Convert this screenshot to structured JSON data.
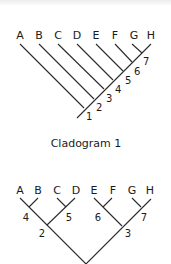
{
  "cladogram1": {
    "caption": "Cladogram 1",
    "taxa": [
      "A",
      "B",
      "C",
      "D",
      "E",
      "F",
      "G",
      "H"
    ],
    "nodes": [
      "1",
      "2",
      "3",
      "4",
      "5",
      "6",
      "7"
    ]
  },
  "cladogram2": {
    "taxa": [
      "A",
      "B",
      "C",
      "D",
      "E",
      "F",
      "G",
      "H"
    ],
    "nodes": {
      "n2": "2",
      "n3": "3",
      "n4": "4",
      "n5": "5",
      "n6": "6",
      "n7": "7"
    }
  }
}
